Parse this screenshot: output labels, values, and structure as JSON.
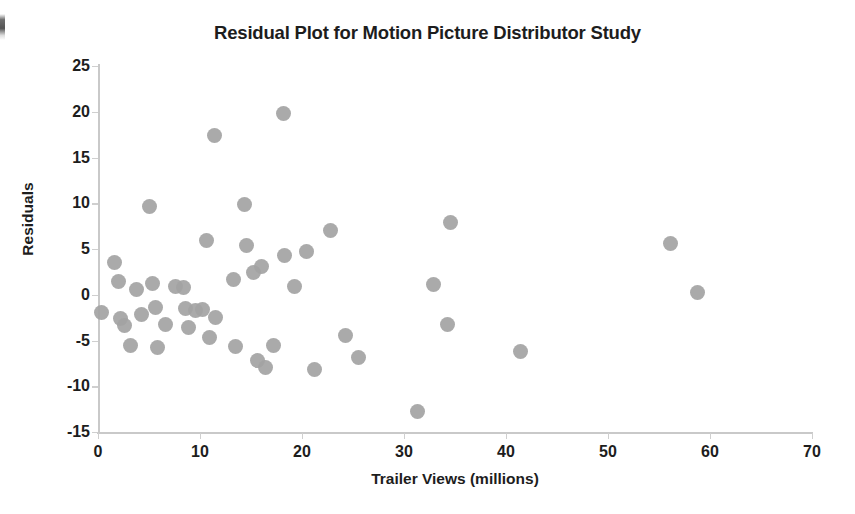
{
  "chart_data": {
    "type": "scatter",
    "title": "Residual Plot for Motion Picture Distributor Study",
    "xlabel": "Trailer Views (millions)",
    "ylabel": "Residuals",
    "xlim": [
      0,
      70
    ],
    "ylim": [
      -15,
      25
    ],
    "xticks": [
      "0",
      "10",
      "20",
      "30",
      "40",
      "50",
      "60",
      "70"
    ],
    "yticks": [
      "25",
      "20",
      "15",
      "10",
      "5",
      "0",
      "-5",
      "-10",
      "-15"
    ],
    "xtick_values": [
      0,
      10,
      20,
      30,
      40,
      50,
      60,
      70
    ],
    "ytick_values": [
      25,
      20,
      15,
      10,
      5,
      0,
      -5,
      -10,
      -15
    ],
    "grid": false,
    "legend": null,
    "marker": {
      "shape": "circle",
      "color": "#a3a3a3",
      "size_px": 15
    },
    "series": [
      {
        "name": "Residuals",
        "points": [
          [
            0.3,
            -1.9
          ],
          [
            1.6,
            3.5
          ],
          [
            2.0,
            1.4
          ],
          [
            2.2,
            -2.6
          ],
          [
            2.6,
            -3.4
          ],
          [
            3.2,
            -5.5
          ],
          [
            3.8,
            0.6
          ],
          [
            4.3,
            -2.2
          ],
          [
            5.0,
            9.7
          ],
          [
            5.3,
            1.2
          ],
          [
            5.6,
            -1.4
          ],
          [
            5.8,
            -5.8
          ],
          [
            6.6,
            -3.2
          ],
          [
            7.6,
            0.9
          ],
          [
            8.4,
            0.8
          ],
          [
            8.6,
            -1.5
          ],
          [
            8.9,
            -3.6
          ],
          [
            9.6,
            -1.7
          ],
          [
            10.2,
            -1.6
          ],
          [
            10.6,
            5.9
          ],
          [
            10.9,
            -4.7
          ],
          [
            11.4,
            17.4
          ],
          [
            11.5,
            -2.5
          ],
          [
            13.3,
            1.7
          ],
          [
            13.5,
            -5.7
          ],
          [
            14.4,
            9.9
          ],
          [
            14.6,
            5.4
          ],
          [
            15.2,
            2.4
          ],
          [
            15.6,
            -7.2
          ],
          [
            16.0,
            3.1
          ],
          [
            16.4,
            -7.9
          ],
          [
            17.2,
            -5.5
          ],
          [
            18.2,
            19.8
          ],
          [
            18.3,
            4.3
          ],
          [
            19.3,
            0.9
          ],
          [
            20.4,
            4.7
          ],
          [
            21.2,
            -8.2
          ],
          [
            22.8,
            7.0
          ],
          [
            24.3,
            -4.5
          ],
          [
            25.5,
            -6.8
          ],
          [
            31.3,
            -12.8
          ],
          [
            32.9,
            1.1
          ],
          [
            34.3,
            -3.2
          ],
          [
            34.6,
            7.9
          ],
          [
            41.4,
            -6.2
          ],
          [
            56.1,
            5.6
          ],
          [
            58.8,
            0.2
          ]
        ]
      }
    ]
  }
}
